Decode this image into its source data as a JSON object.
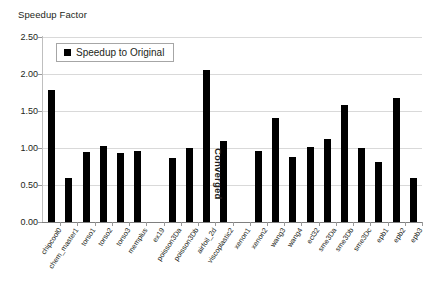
{
  "chart_data": {
    "type": "bar",
    "title": "Speedup Factor",
    "xlabel": "",
    "ylabel": "Speedup Factor",
    "ylim": [
      0.0,
      2.5
    ],
    "ytick_labels": [
      "2.50",
      "2.00",
      "1.50",
      "1.00",
      "0.50",
      "0.00"
    ],
    "yticks": [
      2.5,
      2.0,
      1.5,
      1.0,
      0.5,
      0.0
    ],
    "grid": true,
    "legend_position": "upper-left-inside",
    "legend": [
      "Speedup to Original"
    ],
    "categories": [
      "chipcool0",
      "chem_master1",
      "torso1",
      "torso2",
      "torso3",
      "memplus",
      "ex19",
      "poisson3Da",
      "poisson3Db",
      "airfoil_2d",
      "viscoplastic2",
      "xenon1",
      "xenon2",
      "wang3",
      "wang4",
      "ecl32",
      "sme3Da",
      "sme3Db",
      "sme3Dc",
      "epb1",
      "epb2",
      "epb3"
    ],
    "series": [
      {
        "name": "Speedup to Original",
        "values": [
          1.79,
          0.59,
          0.95,
          1.03,
          0.93,
          0.96,
          null,
          0.86,
          1.0,
          2.06,
          1.1,
          null,
          0.96,
          1.41,
          0.88,
          1.02,
          1.12,
          1.58,
          1.0,
          0.81,
          1.68,
          0.6
        ]
      }
    ],
    "annotations": [
      {
        "text": "Converged",
        "orientation": "vertical",
        "near_category": "xenon1"
      }
    ]
  },
  "legend": {
    "label": "Speedup to Original"
  },
  "annotations": {
    "converged": "Converged"
  },
  "colors": {
    "bar": "#000000",
    "grid": "#d9d9d9",
    "axis": "#7f7f7f",
    "text": "#231f20",
    "background": "#ffffff"
  }
}
